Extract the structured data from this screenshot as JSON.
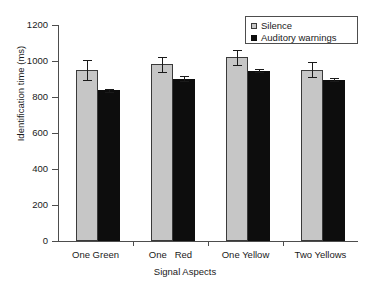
{
  "chart_data": {
    "type": "bar",
    "title": "",
    "xlabel": "Signal Aspects",
    "ylabel": "Identification time (ms)",
    "ylim": [
      0,
      1200
    ],
    "ytick_step": 200,
    "yticks": [
      0,
      200,
      400,
      600,
      800,
      1000,
      1200
    ],
    "ytick_labels": [
      "0",
      "200",
      "400",
      "600",
      "800",
      "1000",
      "1200"
    ],
    "grid": false,
    "legend_position": "top-right",
    "categories": [
      "One Green",
      "One   Red",
      "One Yellow",
      "Two Yellows"
    ],
    "series": [
      {
        "name": "Silence",
        "color": "#c6c6c6",
        "values": [
          948,
          982,
          1020,
          952
        ],
        "errors": [
          55,
          42,
          42,
          42
        ]
      },
      {
        "name": "Auditory warnings",
        "color": "#0d0d0d",
        "values": [
          837,
          901,
          947,
          897
        ],
        "errors": [
          8,
          14,
          6,
          6
        ]
      }
    ]
  },
  "legend": {
    "items": [
      {
        "label": "Silence",
        "swatch": "silence"
      },
      {
        "label": "Auditory warnings",
        "swatch": "auditory"
      }
    ]
  }
}
